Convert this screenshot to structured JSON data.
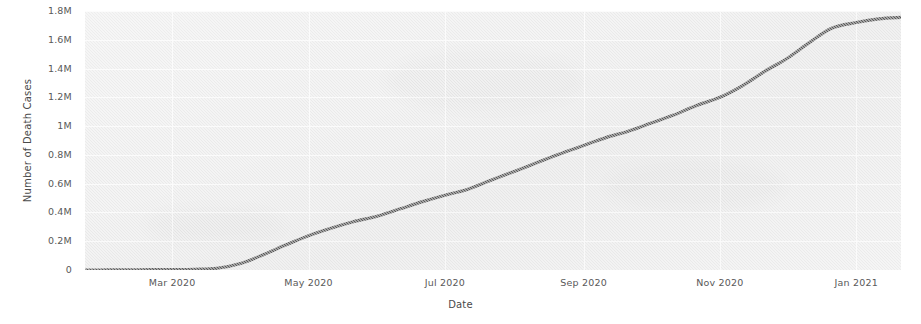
{
  "chart_data": {
    "type": "line",
    "title": "",
    "subtitle": "",
    "xlabel": "Date",
    "ylabel": "Number of Death Cases",
    "grid": true,
    "legend": false,
    "legend_position": "none",
    "line_color": "#4d4d4d",
    "plot_background": "#eaeaea",
    "figure_background": "#ffffff",
    "ylim": [
      0,
      1800000
    ],
    "ytick_labels": [
      "1.8M",
      "1.6M",
      "1.4M",
      "1.2M",
      "1M",
      "0.8M",
      "0.6M",
      "0.4M",
      "0.2M",
      "0"
    ],
    "ytick_values": [
      1800000,
      1600000,
      1400000,
      1200000,
      1000000,
      800000,
      600000,
      400000,
      200000,
      0
    ],
    "xtick_labels": [
      "Mar 2020",
      "May 2020",
      "Jul 2020",
      "Sep 2020",
      "Nov 2020",
      "Jan 2021"
    ],
    "xlim": [
      "2020-01-22",
      "2021-01-21"
    ],
    "series": [
      {
        "name": "Cumulative death cases",
        "x": [
          "2020-01-22",
          "2020-02-01",
          "2020-02-11",
          "2020-02-21",
          "2020-03-01",
          "2020-03-11",
          "2020-03-21",
          "2020-04-01",
          "2020-04-11",
          "2020-04-21",
          "2020-05-01",
          "2020-05-11",
          "2020-05-21",
          "2020-06-01",
          "2020-06-11",
          "2020-06-21",
          "2020-07-01",
          "2020-07-11",
          "2020-07-21",
          "2020-08-01",
          "2020-08-11",
          "2020-08-21",
          "2020-09-01",
          "2020-09-11",
          "2020-09-21",
          "2020-10-01",
          "2020-10-11",
          "2020-10-21",
          "2020-11-01",
          "2020-11-11",
          "2020-11-21",
          "2020-12-01",
          "2020-12-11",
          "2020-12-21",
          "2021-01-01",
          "2021-01-11",
          "2021-01-21"
        ],
        "values": [
          0,
          300,
          1100,
          2400,
          3000,
          5000,
          12000,
          47000,
          108000,
          175000,
          238000,
          290000,
          335000,
          375000,
          425000,
          475000,
          520000,
          560000,
          620000,
          685000,
          745000,
          805000,
          865000,
          920000,
          965000,
          1020000,
          1075000,
          1140000,
          1200000,
          1280000,
          1380000,
          1470000,
          1580000,
          1680000,
          1720000,
          1745000,
          1755000
        ]
      }
    ],
    "annotations": []
  },
  "axes": {
    "y_title": "Number of Death Cases",
    "x_title": "Date"
  }
}
